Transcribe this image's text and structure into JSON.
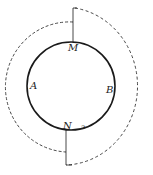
{
  "diagram": {
    "type": "circle-with-dashed-arcs",
    "labels": {
      "M": "M",
      "A": "A",
      "B": "B",
      "N": "N",
      "small_mark": "ɔ"
    },
    "colors": {
      "line": "#1a1a1a",
      "dashed": "#333333",
      "background": "#ffffff"
    }
  }
}
